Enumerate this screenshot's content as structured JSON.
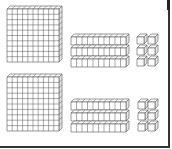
{
  "figure": {
    "stroke_color": "#555555",
    "fill_color": "#ffffff",
    "side_fill": "#e8e8e8",
    "frame_color": "#333333"
  },
  "groups": [
    {
      "name": "top-group",
      "hundreds": 1,
      "tens": 3,
      "ones": 6,
      "value_label": "136",
      "flat": {
        "x": 7,
        "y": 9,
        "w": 52,
        "h": 53
      },
      "rods": [
        {
          "x": 71,
          "y": 37,
          "w": 55,
          "h": 8
        },
        {
          "x": 71,
          "y": 48,
          "w": 55,
          "h": 8
        },
        {
          "x": 71,
          "y": 59,
          "w": 55,
          "h": 8
        }
      ],
      "cubes": [
        {
          "x": 137,
          "y": 37
        },
        {
          "x": 148,
          "y": 37
        },
        {
          "x": 137,
          "y": 48
        },
        {
          "x": 148,
          "y": 48
        },
        {
          "x": 137,
          "y": 59
        },
        {
          "x": 148,
          "y": 59
        }
      ]
    },
    {
      "name": "bottom-group",
      "hundreds": 1,
      "tens": 3,
      "ones": 6,
      "value_label": "136",
      "flat": {
        "x": 7,
        "y": 77,
        "w": 52,
        "h": 54
      },
      "rods": [
        {
          "x": 71,
          "y": 102,
          "w": 55,
          "h": 8
        },
        {
          "x": 71,
          "y": 113,
          "w": 55,
          "h": 8
        },
        {
          "x": 71,
          "y": 124,
          "w": 55,
          "h": 8
        }
      ],
      "cubes": [
        {
          "x": 138,
          "y": 102
        },
        {
          "x": 148,
          "y": 102
        },
        {
          "x": 138,
          "y": 113
        },
        {
          "x": 148,
          "y": 113
        },
        {
          "x": 138,
          "y": 124
        },
        {
          "x": 148,
          "y": 124
        }
      ]
    }
  ]
}
